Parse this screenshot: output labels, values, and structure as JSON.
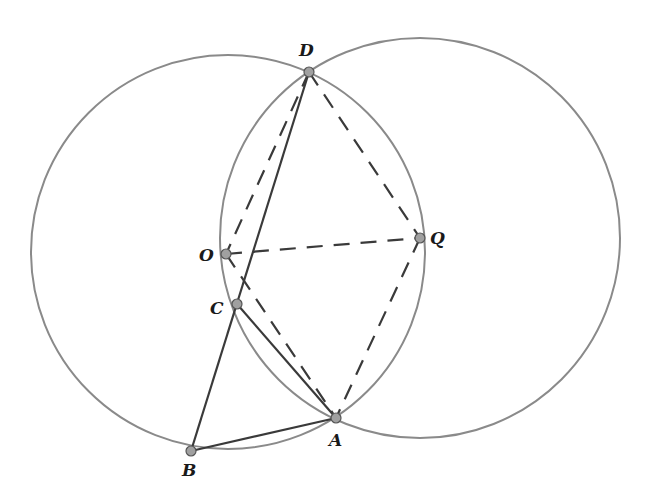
{
  "diagram": {
    "type": "geometry",
    "colors": {
      "circle": "#8a8a8a",
      "line": "#3a3a3a",
      "point_fill": "#a0a0a0"
    },
    "circles": [
      {
        "id": "circle-O",
        "center": "O",
        "cx": 228,
        "cy": 252,
        "r": 197
      },
      {
        "id": "circle-Q",
        "center": "Q",
        "cx": 420,
        "cy": 238,
        "r": 200
      }
    ],
    "points": [
      {
        "name": "D",
        "x": 309,
        "y": 72,
        "lx": 299,
        "ly": 56
      },
      {
        "name": "O",
        "x": 226,
        "y": 254,
        "lx": 199,
        "ly": 261
      },
      {
        "name": "Q",
        "x": 420,
        "y": 238,
        "lx": 430,
        "ly": 244
      },
      {
        "name": "C",
        "x": 237,
        "y": 304,
        "lx": 210,
        "ly": 314
      },
      {
        "name": "A",
        "x": 336,
        "y": 418,
        "lx": 329,
        "ly": 446
      },
      {
        "name": "B",
        "x": 191,
        "y": 451,
        "lx": 182,
        "ly": 476
      }
    ],
    "segments": [
      {
        "from": "D",
        "to": "B",
        "style": "solid"
      },
      {
        "from": "B",
        "to": "A",
        "style": "solid"
      },
      {
        "from": "C",
        "to": "A",
        "style": "solid"
      },
      {
        "from": "D",
        "to": "O",
        "style": "dashed"
      },
      {
        "from": "D",
        "to": "Q",
        "style": "dashed"
      },
      {
        "from": "O",
        "to": "Q",
        "style": "dashed"
      },
      {
        "from": "Q",
        "to": "A",
        "style": "dashed"
      },
      {
        "from": "O",
        "to": "A",
        "style": "dashed"
      }
    ],
    "labels": {
      "D": "D",
      "O": "O",
      "Q": "Q",
      "C": "C",
      "A": "A",
      "B": "B"
    }
  }
}
